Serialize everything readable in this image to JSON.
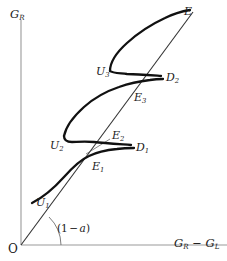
{
  "figure": {
    "type": "line-diagram",
    "background_color": "#ffffff",
    "curve_color": "#111111",
    "axis_color": "#9a9a9a",
    "line_color": "#222222",
    "label_color": "#1a1a1a"
  },
  "axes": {
    "y_label_main": "G",
    "y_label_sub": "R",
    "x_label_left_main": "G",
    "x_label_left_sub": "R",
    "x_label_operator": " − ",
    "x_label_right_main": "G",
    "x_label_right_sub": "L",
    "origin_label": "O",
    "x_axis_y": 245,
    "y_axis_x": 21,
    "y_axis_top": 20,
    "x_axis_right": 227
  },
  "angle_annotation": {
    "open_paren": "(",
    "one": "1",
    "minus": "−",
    "alpha": "a",
    "close_paren": ")",
    "full_text": "(1 − a)",
    "arc_radius": 40
  },
  "points": [
    {
      "id": "U1",
      "main": "U",
      "sub": "1",
      "x": 36,
      "y": 197
    },
    {
      "id": "E1",
      "main": "E",
      "sub": "1",
      "x": 92,
      "y": 161
    },
    {
      "id": "U2",
      "main": "U",
      "sub": "2",
      "x": 67,
      "y": 146
    },
    {
      "id": "E2",
      "main": "E",
      "sub": "2",
      "x": 112,
      "y": 136
    },
    {
      "id": "D1",
      "main": "D",
      "sub": "1",
      "x": 133,
      "y": 147
    },
    {
      "id": "E3",
      "main": "E",
      "sub": "3",
      "x": 134,
      "y": 97
    },
    {
      "id": "U3",
      "main": "U",
      "sub": "3",
      "x": 113,
      "y": 73
    },
    {
      "id": "D2",
      "main": "D",
      "sub": "2",
      "x": 163,
      "y": 77
    },
    {
      "id": "E",
      "main": "E",
      "sub": "",
      "x": 183,
      "y": 10
    }
  ],
  "straight_line": {
    "name": "equilibrium-line",
    "from_x": 21,
    "from_y": 245,
    "to_x": 193,
    "to_y": 12
  },
  "curve": {
    "name": "hysteresis-curve",
    "path": "M 32,203 C 45,196 56,185 66,174 C 76,163 84,156 95,152 C 104,149 112,147 120,146 C 110,146 98,147 90,149 C 80,151 72,152 67,150 C 62,148 62,143 66,136 C 72,126 82,116 93,108 C 104,100 116,94 128,90 C 120,91 112,93 106,96 C 100,99 97,101 97,99 C 97,95 103,87 110,81 C 118,74 130,64 141,55 C 154,44 168,30 180,18"
  }
}
